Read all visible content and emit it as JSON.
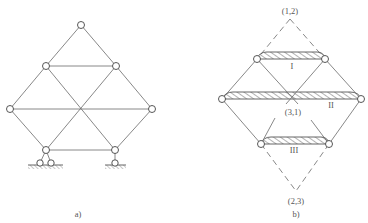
{
  "figure_a": {
    "caption": "a)",
    "nodes": [
      {
        "id": "top",
        "x": 81,
        "y": 25
      },
      {
        "id": "ul",
        "x": 46,
        "y": 66
      },
      {
        "id": "ur",
        "x": 116,
        "y": 66
      },
      {
        "id": "ml",
        "x": 10,
        "y": 109
      },
      {
        "id": "mr",
        "x": 152,
        "y": 109
      },
      {
        "id": "bl",
        "x": 46,
        "y": 150
      },
      {
        "id": "br",
        "x": 115,
        "y": 150
      }
    ],
    "supports": [
      {
        "type": "fixed-pin-double",
        "under": "bl"
      },
      {
        "type": "pin-link",
        "under": "br"
      }
    ]
  },
  "figure_b": {
    "caption": "b)",
    "pole_labels": {
      "top": "(1,2)",
      "center": "(3,1)",
      "bottom": "(2,3)"
    },
    "rigid_bodies": [
      {
        "label": "I"
      },
      {
        "label": "II"
      },
      {
        "label": "III"
      }
    ]
  }
}
